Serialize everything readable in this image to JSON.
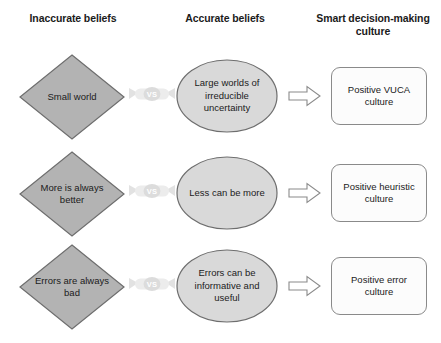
{
  "headers": {
    "inaccurate": "Inaccurate beliefs",
    "accurate": "Accurate beliefs",
    "smart": "Smart decision-making culture"
  },
  "vs_label": "VS",
  "colors": {
    "diamond_fill": "#b3b3b3",
    "diamond_stroke": "#6e6e6e",
    "ellipse_fill": "#d9d9d9",
    "ellipse_stroke": "#6e6e6e",
    "box_fill": "#fcfcfc",
    "box_stroke": "#8a8a8a",
    "arrow_fill": "#ffffff",
    "arrow_stroke": "#8a8a8a",
    "ribbon_fill": "#ebebeb",
    "ribbon_badge": "#dcdcdc",
    "text": "#1b1b1b",
    "background": "#ffffff"
  },
  "rows": [
    {
      "inaccurate_belief": "Small world",
      "accurate_belief": "Large worlds of irreducible uncertainty",
      "culture": "Positive VUCA culture"
    },
    {
      "inaccurate_belief": "More is always better",
      "accurate_belief": "Less can be more",
      "culture": "Positive heuristic culture"
    },
    {
      "inaccurate_belief": "Errors are always bad",
      "accurate_belief": "Errors can be informative and useful",
      "culture": "Positive error culture"
    }
  ]
}
